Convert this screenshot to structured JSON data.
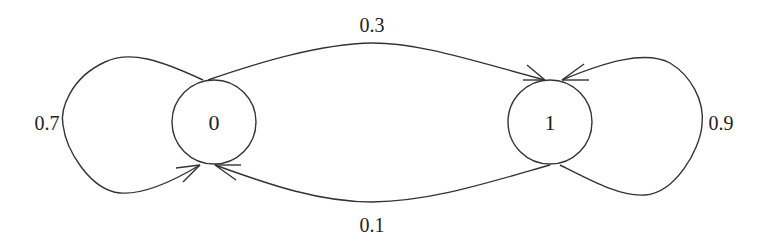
{
  "diagram": {
    "type": "markov-chain",
    "nodes": [
      {
        "id": "0",
        "label": "0"
      },
      {
        "id": "1",
        "label": "1"
      }
    ],
    "edges": [
      {
        "from": "0",
        "to": "0",
        "label": "0.7"
      },
      {
        "from": "0",
        "to": "1",
        "label": "0.3"
      },
      {
        "from": "1",
        "to": "0",
        "label": "0.1"
      },
      {
        "from": "1",
        "to": "1",
        "label": "0.9"
      }
    ]
  }
}
